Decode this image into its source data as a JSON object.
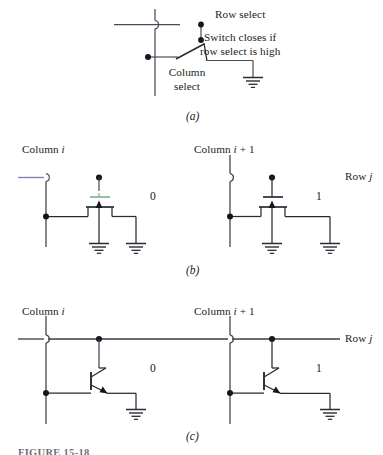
{
  "figure": {
    "caption": "FIGURE 15-18",
    "panels": [
      {
        "tag": "(a)",
        "kind": "switch-cell"
      },
      {
        "tag": "(b)",
        "kind": "mosfet-cells"
      },
      {
        "tag": "(c)",
        "kind": "bjt-cells"
      }
    ]
  },
  "panel_a": {
    "tag": "(a)",
    "row_select_label": "Row select",
    "switch_note_line1": "Switch closes if",
    "switch_note_line2": "row select is high",
    "column_select_line1": "Column",
    "column_select_line2": "select",
    "symbols": {
      "ground": "ground-symbol",
      "switch": "spst-switch",
      "junction": "junction-dot"
    }
  },
  "panel_b": {
    "tag": "(b)",
    "column_left_prefix": "Column ",
    "column_left_index": "i",
    "column_right_prefix": "Column ",
    "column_right_index": "i",
    "column_right_suffix": " + 1",
    "row_label_prefix": "Row ",
    "row_label_index": "j",
    "cells": [
      {
        "value": "0",
        "device": "mosfet-floating-gate",
        "state": "gate-disconnected"
      },
      {
        "value": "1",
        "device": "mosfet",
        "state": "gate-connected"
      }
    ],
    "symbols": {
      "device": "mosfet-symbol",
      "ground": "ground-symbol",
      "junction": "junction-dot",
      "crossing": "wire-hop"
    }
  },
  "panel_c": {
    "tag": "(c)",
    "column_left_prefix": "Column ",
    "column_left_index": "i",
    "column_right_prefix": "Column ",
    "column_right_index": "i",
    "column_right_suffix": " + 1",
    "row_label_prefix": "Row ",
    "row_label_index": "j",
    "cells": [
      {
        "value": "0",
        "device": "npn-bjt",
        "state": "base-disconnected"
      },
      {
        "value": "1",
        "device": "npn-bjt",
        "state": "base-connected"
      }
    ],
    "symbols": {
      "device": "npn-bjt-symbol",
      "ground": "ground-symbol",
      "junction": "junction-dot",
      "crossing": "wire-hop"
    }
  },
  "colors": {
    "ink": "#1b1b22",
    "wire": "#3a3a46",
    "wire_tint_violet": "#8f74b5",
    "wire_tint_green": "#5f9d7f",
    "wire_tint_red": "#b05a62",
    "background": "#ffffff",
    "caption": "#6f6f78"
  }
}
